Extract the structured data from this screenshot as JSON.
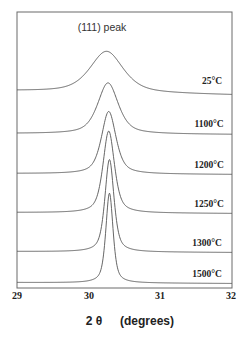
{
  "chart_data": {
    "type": "line",
    "title": "",
    "annotation": "(111)  peak",
    "xlabel": "2 θ    (degrees)",
    "ylabel": "",
    "xlim": [
      29,
      32
    ],
    "x_ticks": [
      29,
      30,
      31,
      32
    ],
    "x_tick_labels": [
      "29",
      "30",
      "31",
      "32"
    ],
    "grid": false,
    "legend": "inline labels at right of each trace",
    "peak_position_2theta": 30.27,
    "stacked_offset": true,
    "series": [
      {
        "name": "25°C",
        "peak_x": 30.25,
        "fwhm_deg": 0.55,
        "relative_height": 0.47,
        "baseline_y_px": 93
      },
      {
        "name": "1100°C",
        "peak_x": 30.27,
        "fwhm_deg": 0.34,
        "relative_height": 0.58,
        "baseline_y_px": 134
      },
      {
        "name": "1200°C",
        "peak_x": 30.28,
        "fwhm_deg": 0.24,
        "relative_height": 0.71,
        "baseline_y_px": 174
      },
      {
        "name": "1250°C",
        "peak_x": 30.28,
        "fwhm_deg": 0.19,
        "relative_height": 0.93,
        "baseline_y_px": 213
      },
      {
        "name": "1300°C",
        "peak_x": 30.29,
        "fwhm_deg": 0.15,
        "relative_height": 1.05,
        "baseline_y_px": 252
      },
      {
        "name": "1500°C",
        "peak_x": 30.29,
        "fwhm_deg": 0.12,
        "relative_height": 1.02,
        "baseline_y_px": 283
      }
    ]
  },
  "labels": {
    "annotation": "(111)  peak",
    "xlabel_theta": "2 θ",
    "xlabel_unit": "(degrees)",
    "ticks": [
      "29",
      "30",
      "31",
      "32"
    ],
    "series": [
      "25°C",
      "1100°C",
      "1200°C",
      "1250°C",
      "1300°C",
      "1500°C"
    ]
  }
}
